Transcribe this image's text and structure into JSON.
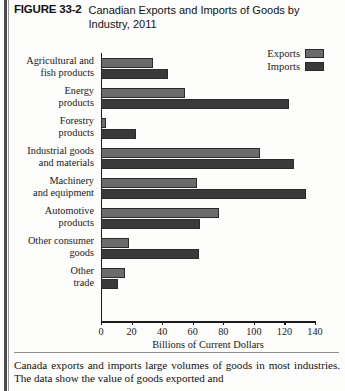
{
  "figure": {
    "number": "FIGURE 33-2",
    "title": "Canadian Exports and Imports of Goods by Industry, 2011",
    "caption": "Canada exports and imports large volumes of goods in most industries. The data show the value of goods exported and"
  },
  "legend": {
    "position": "top-right",
    "entries": [
      {
        "label": "Exports",
        "color": "#6b6b6b"
      },
      {
        "label": "Imports",
        "color": "#3a3a3a"
      }
    ]
  },
  "axis": {
    "title": "Billions of Current Dollars",
    "ticks": [
      "0",
      "20",
      "40",
      "60",
      "80",
      "100",
      "120",
      "140"
    ]
  },
  "chart_data": {
    "type": "bar",
    "orientation": "horizontal",
    "title": "Canadian Exports and Imports of Goods by Industry, 2011",
    "xlabel": "Billions of Current Dollars",
    "ylabel": "",
    "xlim": [
      0,
      140
    ],
    "xticks": [
      0,
      20,
      40,
      60,
      80,
      100,
      120,
      140
    ],
    "grid": false,
    "legend_position": "top-right",
    "categories": [
      "Agricultural and fish products",
      "Energy products",
      "Forestry products",
      "Industrial goods and materials",
      "Machinery and equipment",
      "Automotive products",
      "Other consumer goods",
      "Other trade"
    ],
    "series": [
      {
        "name": "Exports",
        "color": "#6b6b6b",
        "values": [
          34,
          55,
          3,
          104,
          63,
          77,
          18,
          16
        ]
      },
      {
        "name": "Imports",
        "color": "#3a3a3a",
        "values": [
          44,
          123,
          23,
          126,
          134,
          65,
          64,
          11
        ]
      }
    ]
  },
  "rows": [
    {
      "label_line1": "Agricultural and",
      "label_line2": "fish products"
    },
    {
      "label_line1": "Energy",
      "label_line2": "products"
    },
    {
      "label_line1": "Forestry",
      "label_line2": "products"
    },
    {
      "label_line1": "Industrial goods",
      "label_line2": "and materials"
    },
    {
      "label_line1": "Machinery",
      "label_line2": "and equipment"
    },
    {
      "label_line1": "Automotive",
      "label_line2": "products"
    },
    {
      "label_line1": "Other consumer",
      "label_line2": "goods"
    },
    {
      "label_line1": "Other",
      "label_line2": "trade"
    }
  ]
}
